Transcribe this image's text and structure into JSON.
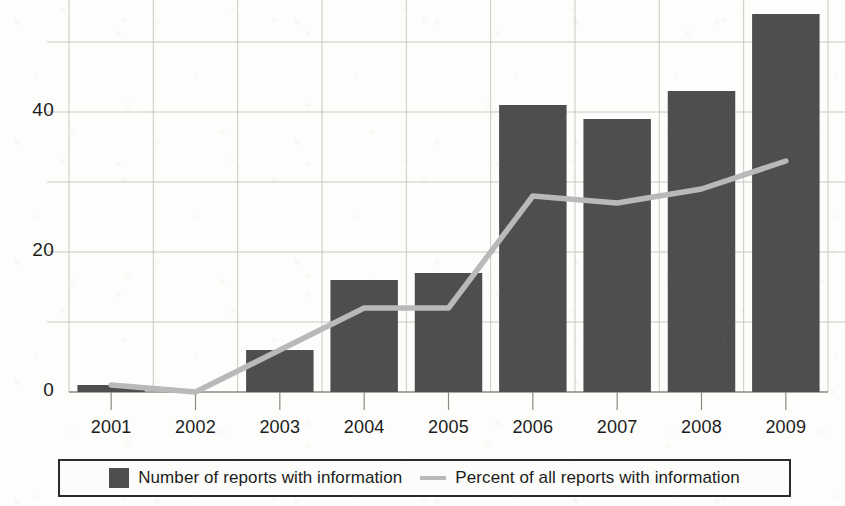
{
  "chart_data": {
    "type": "bar",
    "title": "",
    "subtitle": "",
    "xlabel": "",
    "ylabel": "",
    "categories": [
      "2001",
      "2002",
      "2003",
      "2004",
      "2005",
      "2006",
      "2007",
      "2008",
      "2009"
    ],
    "series": [
      {
        "name": "Number of reports with information",
        "type": "bar",
        "color": "#4e4e4e",
        "values": [
          1,
          0,
          6,
          16,
          17,
          41,
          39,
          43,
          54
        ]
      },
      {
        "name": "Percent of all reports with information",
        "type": "line",
        "color": "#b9b9b9",
        "values": [
          1,
          0,
          6,
          12,
          12,
          28,
          27,
          29,
          33
        ]
      }
    ],
    "ylim": [
      0,
      56
    ],
    "ytick_labels": [
      "0",
      "20",
      "40"
    ],
    "ytick_values": [
      0,
      20,
      40
    ],
    "gridline_values": [
      10,
      20,
      30,
      40,
      50
    ],
    "grid": true,
    "legend_position": "bottom",
    "annotations": []
  },
  "legend": {
    "entries": [
      {
        "label": "Number of reports with information",
        "marker": "bar-swatch-icon"
      },
      {
        "label": "Percent of all reports with information",
        "marker": "line-swatch-icon"
      }
    ]
  },
  "axis": {
    "y_labels": [
      "40",
      "20",
      "0"
    ],
    "x_labels": [
      "2001",
      "2002",
      "2003",
      "2004",
      "2005",
      "2006",
      "2007",
      "2008",
      "2009"
    ]
  },
  "colors": {
    "bar": "#4e4e4e",
    "line": "#b9b9b9",
    "grid": "#c9c9c4",
    "axis": "#8a8a85",
    "text": "#1c1c1c",
    "background": "#fdfdfb",
    "legend_border": "#2b2b2b"
  }
}
